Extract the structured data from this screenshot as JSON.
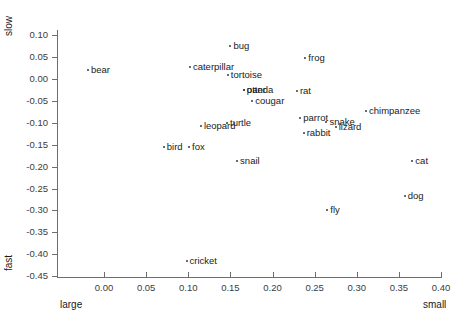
{
  "chart_data": {
    "type": "scatter",
    "title": "",
    "xlabel": "",
    "ylabel": "",
    "axis_end_labels": {
      "y_top": "slow",
      "y_bottom": "fast",
      "x_left": "large",
      "x_right": "small"
    },
    "xlim": [
      -0.025,
      0.4
    ],
    "ylim": [
      -0.465,
      0.115
    ],
    "xticks": [
      0.0,
      0.05,
      0.1,
      0.15,
      0.2,
      0.25,
      0.3,
      0.35,
      0.4
    ],
    "xtick_labels": [
      "0.00",
      "0.05",
      "0.10",
      "0.15",
      "0.20",
      "0.25",
      "0.30",
      "0.35",
      "0.40"
    ],
    "yticks": [
      0.1,
      0.05,
      0.0,
      -0.05,
      -0.1,
      -0.15,
      -0.2,
      -0.25,
      -0.3,
      -0.35,
      -0.4,
      -0.45
    ],
    "ytick_labels": [
      "0.10",
      "0.05",
      "0.00",
      "-0.05",
      "-0.10",
      "-0.15",
      "-0.20",
      "-0.25",
      "-0.30",
      "-0.35",
      "-0.40",
      "-0.45"
    ],
    "grid": false,
    "legend": false,
    "marker_color": "#3a3a3a",
    "axis_color": "#6e6e6e",
    "points": [
      {
        "label": "bear",
        "x": -0.019,
        "y": 0.02,
        "side": "right"
      },
      {
        "label": "bug",
        "x": 0.15,
        "y": 0.075,
        "side": "right"
      },
      {
        "label": "frog",
        "x": 0.239,
        "y": 0.048,
        "side": "right"
      },
      {
        "label": "caterpillar",
        "x": 0.102,
        "y": 0.028,
        "side": "right"
      },
      {
        "label": "tortoise",
        "x": 0.147,
        "y": 0.01,
        "side": "right"
      },
      {
        "label": "panda",
        "x": 0.166,
        "y": -0.025,
        "side": "right"
      },
      {
        "label": "otter",
        "x": 0.166,
        "y": -0.025,
        "side": "right"
      },
      {
        "label": "rat",
        "x": 0.229,
        "y": -0.027,
        "side": "right"
      },
      {
        "label": "cougar",
        "x": 0.176,
        "y": -0.05,
        "side": "right"
      },
      {
        "label": "chimpanzee",
        "x": 0.311,
        "y": -0.073,
        "side": "right"
      },
      {
        "label": "parrot",
        "x": 0.233,
        "y": -0.089,
        "side": "right"
      },
      {
        "label": "snake",
        "x": 0.264,
        "y": -0.098,
        "side": "right"
      },
      {
        "label": "turtle",
        "x": 0.146,
        "y": -0.1,
        "side": "right"
      },
      {
        "label": "leopard",
        "x": 0.115,
        "y": -0.108,
        "side": "right"
      },
      {
        "label": "lizard",
        "x": 0.275,
        "y": -0.11,
        "side": "right"
      },
      {
        "label": "rabbit",
        "x": 0.237,
        "y": -0.123,
        "side": "right"
      },
      {
        "label": "bird",
        "x": 0.071,
        "y": -0.155,
        "side": "right"
      },
      {
        "label": "fox",
        "x": 0.101,
        "y": -0.155,
        "side": "right"
      },
      {
        "label": "cat",
        "x": 0.366,
        "y": -0.188,
        "side": "right"
      },
      {
        "label": "snail",
        "x": 0.158,
        "y": -0.188,
        "side": "right"
      },
      {
        "label": "dog",
        "x": 0.357,
        "y": -0.266,
        "side": "right"
      },
      {
        "label": "fly",
        "x": 0.265,
        "y": -0.298,
        "side": "right"
      },
      {
        "label": "cricket",
        "x": 0.098,
        "y": -0.416,
        "side": "right"
      }
    ]
  }
}
